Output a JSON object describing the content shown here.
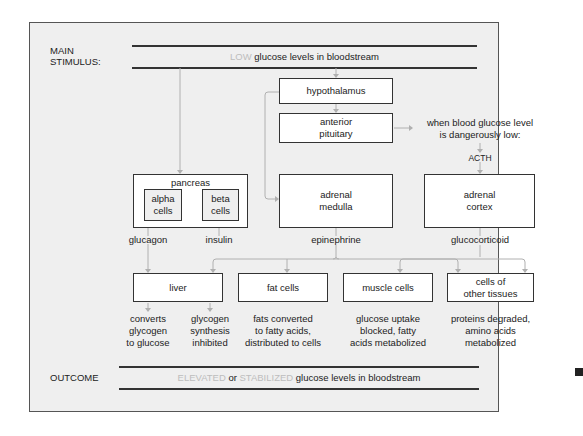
{
  "diagram": {
    "stimulus_label": "MAIN\nSTIMULUS:",
    "stimulus_label_line1": "MAIN",
    "stimulus_label_line2": "STIMULUS:",
    "stimulus": {
      "ghost": "LOW",
      "text": " glucose levels in bloodstream"
    },
    "outcome_label": "OUTCOME",
    "outcome": {
      "ghost1": "ELEVATED",
      "mid": " or ",
      "ghost2": "STABILIZED",
      "text": " glucose levels in bloodstream"
    },
    "nodes": {
      "hypothalamus": "hypothalamus",
      "anterior_pituitary": [
        "anterior",
        "pituitary"
      ],
      "pancreas": "pancreas",
      "alpha_cells": [
        "alpha",
        "cells"
      ],
      "beta_cells": [
        "beta",
        "cells"
      ],
      "adrenal_medulla": [
        "adrenal",
        "medulla"
      ],
      "adrenal_cortex": [
        "adrenal",
        "cortex"
      ],
      "liver": "liver",
      "fat_cells": "fat cells",
      "muscle_cells": "muscle cells",
      "other_tissues": [
        "cells of",
        "other tissues"
      ]
    },
    "condition_note": [
      "when blood glucose level",
      "is dangerously low:"
    ],
    "hormones": {
      "acth": "ACTH",
      "glucagon": "glucagon",
      "insulin": "insulin",
      "epinephrine": "epinephrine",
      "glucocorticoid": "glucocorticoid"
    },
    "effects": {
      "liver_1": [
        "converts",
        "glycogen",
        "to glucose"
      ],
      "liver_2": [
        "glycogen",
        "synthesis",
        "inhibited"
      ],
      "fat": [
        "fats converted",
        "to fatty acids,",
        "distributed to cells"
      ],
      "muscle": [
        "glucose uptake",
        "blocked, fatty",
        "acids metabolized"
      ],
      "other": [
        "proteins degraded,",
        "amino acids",
        "metabolized"
      ]
    },
    "colors": {
      "ghost_text": "#bdbdbd",
      "frame_bg": "#efefef",
      "connector": "#b0b0b0",
      "border": "#333333"
    }
  }
}
